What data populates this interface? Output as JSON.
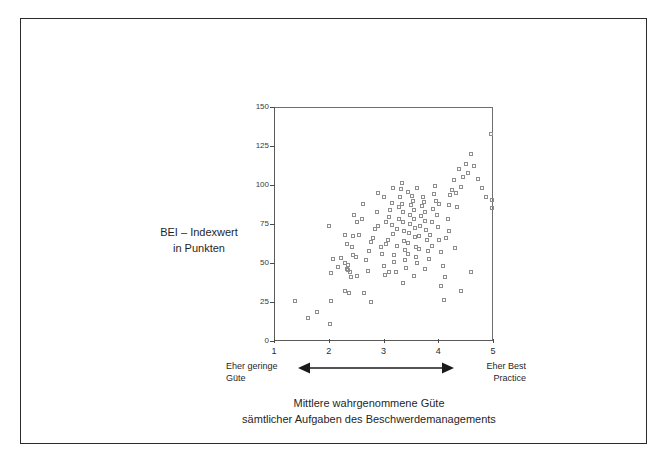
{
  "figure": {
    "y_axis_title_line1": "BEI – Indexwert",
    "y_axis_title_line2": "in Punkten",
    "left_anchor_line1": "Eher geringe",
    "left_anchor_line2": "Güte",
    "right_anchor_line1": "Eher Best",
    "right_anchor_line2": "Practice",
    "caption_line1": "Mittlere wahrgenommene Güte",
    "caption_line2": "sämtlicher Aufgaben des Beschwerdemanagements",
    "arrow_name": "double-headed-arrow",
    "frame_color": "#2b2b2b",
    "axis_color": "#4a4a4a",
    "marker_color": "#8d8d8d"
  },
  "chart_data": {
    "type": "scatter",
    "title": "",
    "xlabel": "Mittlere wahrgenommene Güte sämtlicher Aufgaben des Beschwerdemanagements",
    "ylabel": "BEI – Indexwert in Punkten",
    "xlim": [
      1,
      5
    ],
    "ylim": [
      0,
      150
    ],
    "xticks": [
      1,
      2,
      3,
      4,
      5
    ],
    "yticks": [
      0,
      25,
      50,
      75,
      100,
      125,
      150
    ],
    "grid": false,
    "legend": null,
    "marker": "open-square",
    "x_anchor_low": "Eher geringe Güte",
    "x_anchor_high": "Eher Best Practice",
    "points": [
      [
        1.38,
        25.5
      ],
      [
        1.63,
        15.0
      ],
      [
        1.78,
        18.5
      ],
      [
        2.03,
        11.0
      ],
      [
        2.05,
        25.5
      ],
      [
        2.05,
        43.5
      ],
      [
        2.0,
        74.0
      ],
      [
        2.08,
        52.5
      ],
      [
        2.22,
        53.0
      ],
      [
        2.17,
        47.5
      ],
      [
        2.3,
        50.0
      ],
      [
        2.33,
        46.0
      ],
      [
        2.35,
        48.5
      ],
      [
        2.36,
        45.5
      ],
      [
        2.38,
        44.0
      ],
      [
        2.33,
        62.0
      ],
      [
        2.42,
        60.5
      ],
      [
        2.3,
        68.0
      ],
      [
        2.45,
        67.5
      ],
      [
        2.3,
        32.0
      ],
      [
        2.37,
        30.5
      ],
      [
        2.4,
        41.0
      ],
      [
        2.52,
        41.5
      ],
      [
        2.5,
        54.0
      ],
      [
        2.56,
        68.0
      ],
      [
        2.52,
        76.5
      ],
      [
        2.47,
        80.5
      ],
      [
        2.6,
        78.0
      ],
      [
        2.65,
        31.0
      ],
      [
        2.78,
        25.0
      ],
      [
        2.72,
        45.0
      ],
      [
        2.74,
        58.0
      ],
      [
        2.8,
        66.0
      ],
      [
        2.85,
        71.5
      ],
      [
        2.88,
        83.0
      ],
      [
        2.9,
        95.0
      ],
      [
        2.95,
        60.5
      ],
      [
        2.98,
        55.5
      ],
      [
        3.0,
        48.0
      ],
      [
        3.02,
        42.0
      ],
      [
        3.05,
        62.5
      ],
      [
        3.08,
        65.0
      ],
      [
        3.05,
        76.0
      ],
      [
        3.1,
        79.5
      ],
      [
        3.12,
        84.0
      ],
      [
        3.15,
        88.5
      ],
      [
        3.15,
        74.5
      ],
      [
        3.18,
        68.5
      ],
      [
        3.2,
        55.0
      ],
      [
        3.2,
        50.5
      ],
      [
        3.22,
        44.5
      ],
      [
        3.25,
        61.0
      ],
      [
        3.25,
        72.0
      ],
      [
        3.28,
        78.5
      ],
      [
        3.28,
        86.0
      ],
      [
        3.3,
        92.0
      ],
      [
        3.32,
        97.5
      ],
      [
        3.33,
        101.0
      ],
      [
        3.34,
        88.0
      ],
      [
        3.35,
        82.5
      ],
      [
        3.36,
        76.0
      ],
      [
        3.38,
        70.5
      ],
      [
        3.38,
        64.0
      ],
      [
        3.4,
        58.5
      ],
      [
        3.4,
        52.0
      ],
      [
        3.42,
        47.0
      ],
      [
        3.44,
        56.0
      ],
      [
        3.45,
        63.0
      ],
      [
        3.46,
        69.0
      ],
      [
        3.48,
        75.0
      ],
      [
        3.48,
        81.0
      ],
      [
        3.5,
        87.5
      ],
      [
        3.52,
        93.0
      ],
      [
        3.53,
        90.0
      ],
      [
        3.55,
        84.0
      ],
      [
        3.56,
        78.0
      ],
      [
        3.57,
        72.5
      ],
      [
        3.58,
        66.5
      ],
      [
        3.6,
        60.0
      ],
      [
        3.6,
        54.0
      ],
      [
        3.62,
        50.0
      ],
      [
        3.64,
        59.0
      ],
      [
        3.65,
        67.0
      ],
      [
        3.66,
        73.5
      ],
      [
        3.68,
        80.0
      ],
      [
        3.7,
        86.5
      ],
      [
        3.72,
        92.5
      ],
      [
        3.74,
        89.0
      ],
      [
        3.75,
        83.0
      ],
      [
        3.76,
        77.0
      ],
      [
        3.78,
        71.0
      ],
      [
        3.8,
        65.0
      ],
      [
        3.82,
        58.0
      ],
      [
        3.84,
        52.5
      ],
      [
        3.85,
        68.0
      ],
      [
        3.88,
        76.0
      ],
      [
        3.9,
        84.5
      ],
      [
        3.92,
        94.0
      ],
      [
        3.94,
        99.5
      ],
      [
        3.96,
        90.0
      ],
      [
        3.98,
        81.0
      ],
      [
        4.0,
        73.0
      ],
      [
        4.02,
        64.5
      ],
      [
        4.05,
        57.0
      ],
      [
        4.08,
        48.0
      ],
      [
        4.1,
        26.5
      ],
      [
        4.12,
        41.0
      ],
      [
        4.15,
        66.0
      ],
      [
        4.18,
        78.0
      ],
      [
        4.2,
        87.0
      ],
      [
        4.22,
        93.5
      ],
      [
        4.25,
        97.0
      ],
      [
        4.28,
        103.5
      ],
      [
        4.32,
        95.0
      ],
      [
        4.35,
        86.0
      ],
      [
        4.38,
        110.0
      ],
      [
        4.42,
        99.0
      ],
      [
        4.45,
        105.0
      ],
      [
        4.5,
        113.5
      ],
      [
        4.55,
        108.0
      ],
      [
        4.6,
        120.0
      ],
      [
        4.65,
        112.0
      ],
      [
        4.72,
        104.0
      ],
      [
        4.8,
        98.0
      ],
      [
        4.88,
        92.0
      ],
      [
        4.96,
        133.0
      ],
      [
        4.98,
        90.5
      ],
      [
        4.98,
        85.5
      ],
      [
        4.6,
        44.0
      ],
      [
        4.42,
        32.0
      ],
      [
        4.3,
        59.5
      ],
      [
        4.05,
        35.0
      ],
      [
        2.62,
        88.0
      ],
      [
        2.9,
        74.0
      ],
      [
        3.1,
        44.0
      ],
      [
        3.35,
        37.0
      ],
      [
        3.55,
        41.5
      ],
      [
        3.75,
        46.0
      ],
      [
        4.02,
        88.0
      ],
      [
        4.2,
        70.5
      ],
      [
        2.78,
        63.5
      ],
      [
        3.0,
        92.0
      ],
      [
        3.62,
        98.0
      ],
      [
        3.88,
        61.0
      ],
      [
        2.45,
        55.0
      ],
      [
        2.68,
        52.0
      ],
      [
        3.18,
        98.0
      ],
      [
        3.44,
        95.5
      ]
    ]
  }
}
